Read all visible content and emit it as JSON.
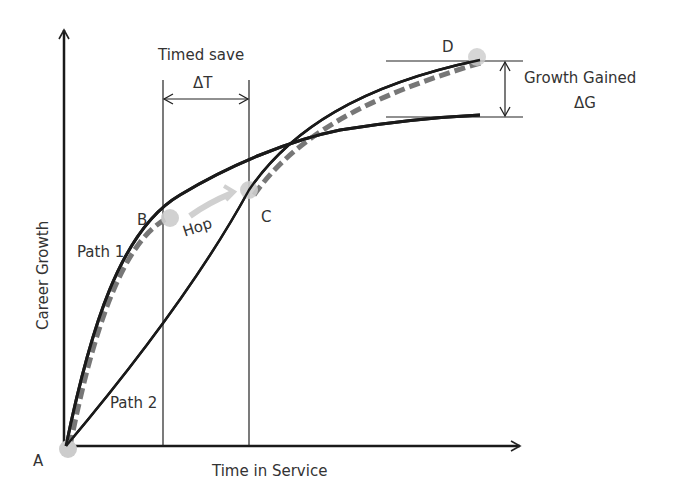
{
  "diagram": {
    "axes": {
      "x_label": "Time in Service",
      "y_label": "Career Growth"
    },
    "points": {
      "A": "A",
      "B": "B",
      "C": "C",
      "D": "D"
    },
    "paths": {
      "path1": "Path 1",
      "path2": "Path 2",
      "hop": "Hop"
    },
    "annotations": {
      "timed_save_title": "Timed save",
      "timed_save_delta": "ΔT",
      "growth_gained_title": "Growth Gained",
      "growth_gained_delta": "ΔG"
    },
    "colors": {
      "line": "#1a1a1a",
      "dashed": "#777777",
      "point": "#cccccc",
      "text": "#333333"
    }
  }
}
